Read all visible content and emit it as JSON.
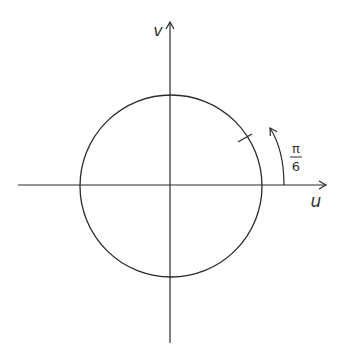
{
  "diagram": {
    "type": "unit-circle-in-uv-plane",
    "axes": {
      "horizontal_label": "u",
      "vertical_label": "v"
    },
    "angle_annotation": {
      "numerator": "π",
      "denominator": "6"
    },
    "colors": {
      "stroke": "#2a2a2a",
      "text": "#333333",
      "background": "#ffffff"
    }
  }
}
